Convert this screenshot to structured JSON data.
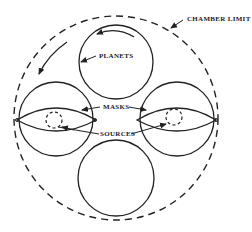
{
  "diagram": {
    "labels": {
      "chamber_limit": "CHAMBER LIMIT",
      "planets": "PLANETS",
      "masks": "MASKS",
      "sources": "SOURCES"
    },
    "colors": {
      "stroke": "#222222",
      "background": "#ffffff"
    },
    "elements": {
      "chamber": {
        "shape": "dashed-circle",
        "cx": 116,
        "cy": 118,
        "r": 102
      },
      "planets": [
        {
          "position": "top",
          "cx": 116,
          "cy": 62,
          "r": 37
        },
        {
          "position": "left",
          "cx": 56,
          "cy": 119,
          "r": 37
        },
        {
          "position": "right",
          "cx": 177,
          "cy": 119,
          "r": 37
        },
        {
          "position": "bottom",
          "cx": 116,
          "cy": 178,
          "r": 38
        }
      ],
      "masks": [
        {
          "position": "left",
          "shape": "lens"
        },
        {
          "position": "right",
          "shape": "lens"
        }
      ],
      "sources": [
        {
          "position": "left",
          "shape": "dashed-circle",
          "cx": 54,
          "cy": 120,
          "r": 8
        },
        {
          "position": "right",
          "shape": "dashed-circle",
          "cx": 174,
          "cy": 117,
          "r": 8
        }
      ],
      "rotation_arrows": [
        "planet-rotation",
        "chamber-rotation"
      ]
    }
  }
}
